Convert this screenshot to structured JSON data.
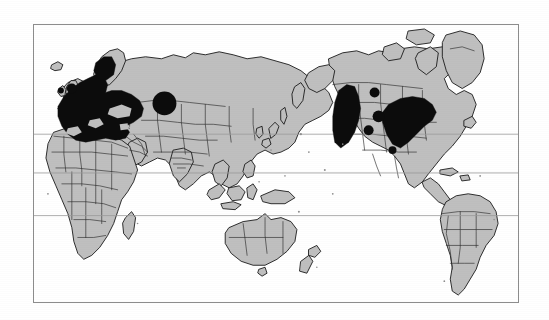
{
  "figure": {
    "kind": "world-distribution-map",
    "projection": "pacific-centered equirectangular",
    "title": "",
    "caption": "",
    "background_color": "#ffffff",
    "frame_color": "#8d8d8d",
    "land_fill": "#bfbfbf",
    "coastline_color": "#1a1a1a",
    "border_color": "#2b2b2b",
    "grid_color": "#9a9a9a",
    "range_fill": "#0c0c0c"
  },
  "frame": {
    "x": 33,
    "y": 24,
    "width": 486,
    "height": 279
  },
  "gridlines": [
    {
      "name": "tropic-of-cancer",
      "y_px": 134,
      "label": ""
    },
    {
      "name": "equator",
      "y_px": 173,
      "label": ""
    },
    {
      "name": "tropic-of-capricorn",
      "y_px": 216,
      "label": ""
    }
  ],
  "legend": {
    "present": false,
    "entries": [
      {
        "swatch": "#0c0c0c",
        "label": ""
      },
      {
        "swatch": "#bfbfbf",
        "label": ""
      }
    ]
  },
  "continents": [
    {
      "name": "europe",
      "shaded": true
    },
    {
      "name": "asia",
      "shaded": true
    },
    {
      "name": "africa",
      "shaded": true
    },
    {
      "name": "north-america",
      "shaded": true
    },
    {
      "name": "south-america",
      "shaded": true
    },
    {
      "name": "australia",
      "shaded": true
    },
    {
      "name": "greenland",
      "shaded": true
    },
    {
      "name": "new-zealand",
      "shaded": true
    },
    {
      "name": "madagascar",
      "shaded": true
    },
    {
      "name": "japan",
      "shaded": true
    },
    {
      "name": "indonesia",
      "shaded": true
    },
    {
      "name": "british-isles",
      "shaded": true
    },
    {
      "name": "iceland",
      "shaded": true
    }
  ],
  "distribution_areas": [
    {
      "name": "europe-core-range",
      "region": "Western, Central and Eastern Europe",
      "type": "filled-area",
      "fill": "#0c0c0c"
    },
    {
      "name": "scandinavia-range",
      "region": "Southern Scandinavia",
      "type": "filled-area",
      "fill": "#0c0c0c"
    },
    {
      "name": "british-isles-range",
      "region": "British Isles",
      "type": "filled-area",
      "fill": "#0c0c0c"
    },
    {
      "name": "central-asia-range",
      "region": "Central Asia / Western Siberia",
      "type": "filled-circle",
      "fill": "#0c0c0c"
    },
    {
      "name": "north-america-west-range",
      "region": "Western North America / Pacific Northwest",
      "type": "filled-area",
      "fill": "#0c0c0c"
    },
    {
      "name": "north-america-east-range",
      "region": "Eastern United States",
      "type": "filled-area",
      "fill": "#0c0c0c"
    },
    {
      "name": "north-america-plains-dot-1",
      "region": "Northern Plains",
      "type": "filled-dot",
      "fill": "#0c0c0c"
    },
    {
      "name": "north-america-plains-dot-2",
      "region": "Central Plains",
      "type": "filled-dot",
      "fill": "#0c0c0c"
    },
    {
      "name": "north-america-plains-dot-3",
      "region": "Southern Plains",
      "type": "filled-dot",
      "fill": "#0c0c0c"
    }
  ]
}
